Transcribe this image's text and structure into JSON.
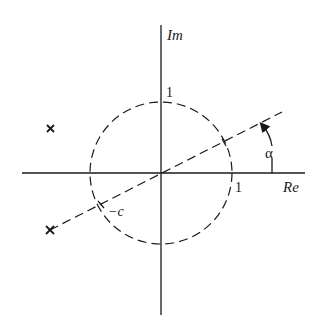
{
  "diagram": {
    "title": "",
    "axes": {
      "real_label": "Re",
      "imag_label": "Im",
      "real_unit_tick": "1",
      "imag_unit_tick": "1"
    },
    "unit_circle": {
      "radius_label": "1",
      "style": "dashed"
    },
    "ray": {
      "angle_label": "α",
      "intersection_label": "−c",
      "style": "dashed"
    },
    "markers": [
      {
        "symbol": "×",
        "position": "upper-left"
      },
      {
        "symbol": "×",
        "position": "lower-left, end of ray"
      }
    ],
    "colors": {
      "ink": "#1a1a1a",
      "background": "#ffffff"
    }
  }
}
